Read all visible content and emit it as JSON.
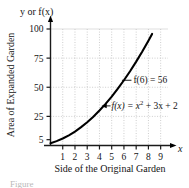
{
  "figure": {
    "caption_partial": "Figure",
    "y_axis_top_label": "y or f(x)",
    "y_axis_title": "Area of Expanded Garden",
    "x_axis_title": "Side of the Original Garden",
    "x_axis_symbol": "x"
  },
  "chart_data": {
    "type": "line",
    "title": "",
    "xlabel": "Side of the Original Garden",
    "ylabel": "Area of Expanded Garden",
    "y_axis_header": "y or f(x)",
    "function": "f(x) = x^2 + 3x + 2",
    "xlim": [
      0,
      9.6
    ],
    "ylim": [
      0,
      105
    ],
    "grid": true,
    "legend": "none",
    "xticks": [
      1,
      2,
      3,
      4,
      5,
      6,
      7,
      8,
      9
    ],
    "xtick_labels": [
      "1",
      "2",
      "3",
      "4",
      "5",
      "6",
      "7",
      "8",
      "9"
    ],
    "yticks": [
      5,
      25,
      50,
      75,
      100
    ],
    "ytick_labels": [
      "5",
      "25",
      "50",
      "75",
      "100"
    ],
    "x": [
      0,
      0.5,
      1,
      1.5,
      2,
      2.5,
      3,
      3.5,
      4,
      4.5,
      5,
      5.5,
      6,
      6.5,
      7,
      7.5,
      8,
      8.3
    ],
    "y": [
      2,
      3.75,
      6,
      8.75,
      12,
      15.75,
      20,
      24.75,
      30,
      35.75,
      42,
      48.75,
      56,
      63.75,
      72,
      80.75,
      90,
      95.8
    ],
    "annotations": [
      {
        "id": "point-value",
        "text": "f(6) = 56",
        "text_x": 6.45,
        "text_y": 56,
        "point_x": 6.0,
        "point_y": 56,
        "leader": "line"
      },
      {
        "id": "function-label",
        "text_parts": {
          "lead": "f(x) = x",
          "exponent": "2",
          "tail": " + 3x + 2"
        },
        "text": "f(x) = x2 + 3x + 2",
        "text_x": 4.55,
        "text_y": 34,
        "point_x": 4.25,
        "point_y": 34,
        "leader": "arrow"
      }
    ]
  },
  "colors": {
    "curve": "#000000",
    "axis": "#1a1a1a",
    "grid": "#b8b8b8",
    "background": "#ffffff"
  }
}
